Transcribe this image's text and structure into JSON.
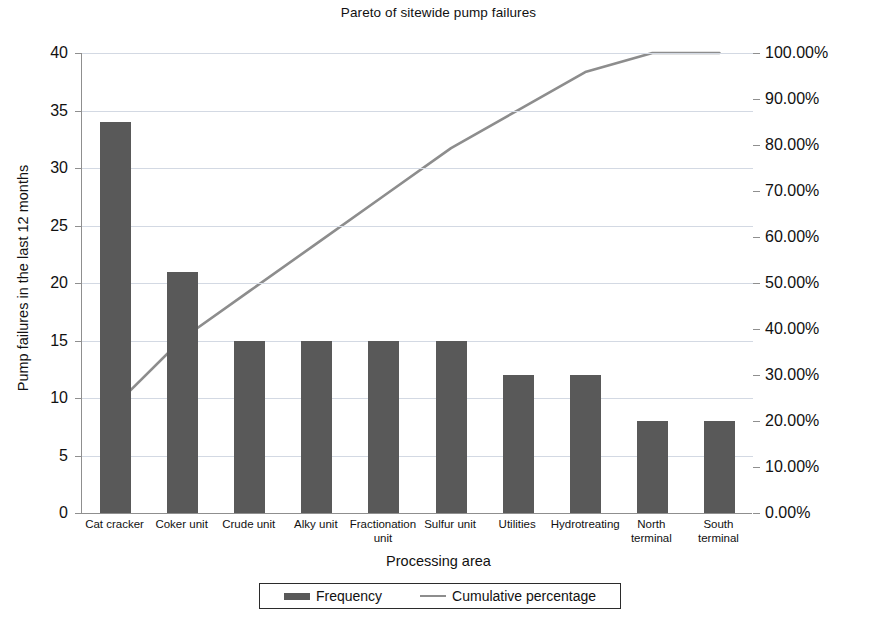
{
  "chart_data": {
    "type": "bar",
    "title": "Pareto of sitewide pump failures",
    "xlabel": "Processing area",
    "ylabel": "Pump failures in the last 12 months",
    "y2label": "",
    "grid": true,
    "legend_position": "bottom",
    "categories": [
      "Cat cracker",
      "Coker unit",
      "Crude unit",
      "Alky unit",
      "Fractionation unit",
      "Sulfur unit",
      "Utilities",
      "Hydrotreating",
      "North terminal",
      "South terminal"
    ],
    "series": [
      {
        "name": "Frequency",
        "type": "bar",
        "axis": "left",
        "color": "#595959",
        "values": [
          34,
          21,
          15,
          15,
          15,
          15,
          12,
          12,
          8,
          8
        ]
      },
      {
        "name": "Cumulative percentage",
        "type": "line",
        "axis": "right",
        "color": "#8d8d8d",
        "values": [
          23.45,
          37.93,
          48.28,
          58.62,
          68.97,
          79.31,
          87.59,
          95.86,
          100.0,
          100.0
        ]
      }
    ],
    "ylim": [
      0,
      40
    ],
    "ytick_step": 5,
    "yticks": [
      0,
      5,
      10,
      15,
      20,
      25,
      30,
      35,
      40
    ],
    "ytick_labels": [
      "0",
      "5",
      "10",
      "15",
      "20",
      "25",
      "30",
      "35",
      "40"
    ],
    "y2lim": [
      0,
      100
    ],
    "y2tick_step": 10,
    "y2ticks": [
      0,
      10,
      20,
      30,
      40,
      50,
      60,
      70,
      80,
      90,
      100
    ],
    "y2tick_labels": [
      "0.00%",
      "10.00%",
      "20.00%",
      "30.00%",
      "40.00%",
      "50.00%",
      "60.00%",
      "70.00%",
      "80.00%",
      "90.00%",
      "100.00%"
    ],
    "total_failures": 145
  },
  "legend": {
    "items": [
      {
        "label": "Frequency",
        "marker": "bar-swatch"
      },
      {
        "label": "Cumulative percentage",
        "marker": "line-swatch"
      }
    ]
  },
  "colors": {
    "bar": "#595959",
    "line": "#8d8d8d",
    "grid": "#d3d9e3",
    "axis": "#8f8f8f",
    "text": "#111111",
    "background": "#ffffff"
  }
}
